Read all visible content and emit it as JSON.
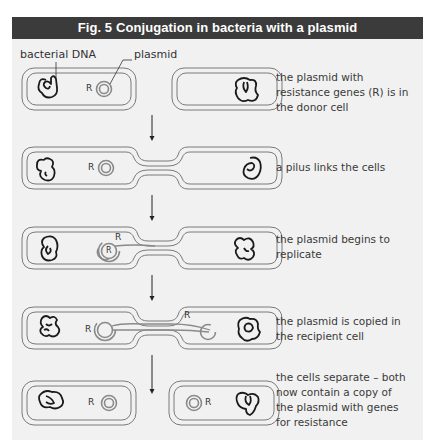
{
  "figure": {
    "title": "Fig. 5  Conjugation in bacteria with a plasmid",
    "colors": {
      "title_bar": "#3b3b3b",
      "title_text": "#ffffff",
      "panel_background": "#f1f1f1",
      "cell_outline": "#777777",
      "dna": "#1a1a1a",
      "plasmid": "#8a8a8a"
    },
    "labels": {
      "bacterial_dna": "bacterial DNA",
      "plasmid": "plasmid",
      "resistance_gene": "R"
    },
    "steps": [
      {
        "id": 1,
        "caption": "the plasmid with resistance genes (R) is in the donor cell",
        "state": "separate-cells-donor-only"
      },
      {
        "id": 2,
        "caption": "a pilus links the cells",
        "state": "pilus-linked"
      },
      {
        "id": 3,
        "caption": "the plasmid begins to replicate",
        "state": "replication-start"
      },
      {
        "id": 4,
        "caption": "the plasmid is copied in the recipient cell",
        "state": "copy-in-recipient"
      },
      {
        "id": 5,
        "caption": "the cells separate – both now contain a copy of the plasmid with genes for resistance",
        "state": "separated-both-resistant"
      }
    ]
  }
}
